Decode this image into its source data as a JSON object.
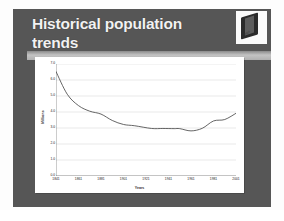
{
  "slide": {
    "title": "Historical population trends",
    "background_color": "#565656",
    "title_color": "#f2f2f2",
    "logo": {
      "icon": "book-logo-icon",
      "caption": "logo"
    }
  },
  "chart_data": {
    "type": "line",
    "title": "",
    "xlabel": "Years",
    "ylabel": "Millions",
    "grid": true,
    "legend": "none",
    "line_color": "#4a4a4a",
    "background_color": "#ffffff",
    "xlim": [
      1841,
      2001
    ],
    "ylim": [
      0.0,
      7.0
    ],
    "yticks": [
      0.0,
      1.0,
      2.0,
      3.0,
      4.0,
      5.0,
      6.0,
      7.0
    ],
    "ytick_labels": [
      "0.0",
      "1.0",
      "2.0",
      "3.0",
      "4.0",
      "5.0",
      "6.0",
      "7.0"
    ],
    "xticks": [
      1841,
      1861,
      1881,
      1901,
      1921,
      1941,
      1961,
      1981,
      2001
    ],
    "xtick_labels": [
      "1841",
      "1861",
      "1881",
      "1901",
      "1921",
      "1941",
      "1961",
      "1981",
      "2001"
    ],
    "series": [
      {
        "name": "Population",
        "x": [
          1841,
          1851,
          1861,
          1871,
          1881,
          1891,
          1901,
          1911,
          1926,
          1936,
          1946,
          1951,
          1961,
          1971,
          1981,
          1991,
          2001
        ],
        "values": [
          6.53,
          5.11,
          4.4,
          4.05,
          3.87,
          3.47,
          3.22,
          3.14,
          2.97,
          2.97,
          2.96,
          2.96,
          2.82,
          2.98,
          3.44,
          3.53,
          3.92
        ]
      }
    ]
  }
}
